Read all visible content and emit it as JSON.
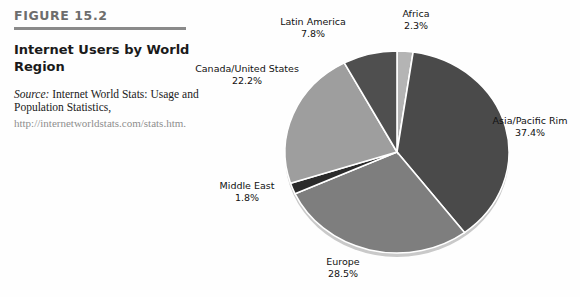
{
  "figure": {
    "number": "FIGURE 15.2",
    "title": "Internet Users by World Region",
    "source_label": "Source:",
    "source_text": " Internet World Stats: Usage and Population Statistics,",
    "source_url": "http://internetworldstats.com/stats.htm."
  },
  "chart_data": {
    "type": "pie",
    "title": "Internet Users by World Region",
    "unit": "%",
    "legend": "none",
    "labels_position": "outside",
    "start_angle_deg": -90,
    "direction": "clockwise",
    "categories": [
      "Africa",
      "Asia/Pacific Rim",
      "Europe",
      "Middle East",
      "Canada/United States",
      "Latin America"
    ],
    "values": [
      2.3,
      37.4,
      28.5,
      1.8,
      22.2,
      7.8
    ],
    "slices": [
      {
        "name": "Africa",
        "value": 2.3,
        "label": "Africa",
        "pct_text": "2.3%",
        "color": "#b4b4b4"
      },
      {
        "name": "Asia/Pacific Rim",
        "value": 37.4,
        "label": "Asia/Pacific Rim",
        "pct_text": "37.4%",
        "color": "#4a4a4a"
      },
      {
        "name": "Europe",
        "value": 28.5,
        "label": "Europe",
        "pct_text": "28.5%",
        "color": "#7e7e7e"
      },
      {
        "name": "Middle East",
        "value": 1.8,
        "label": "Middle East",
        "pct_text": "1.8%",
        "color": "#2b2b2b"
      },
      {
        "name": "Canada/United States",
        "value": 22.2,
        "label": "Canada/United States",
        "pct_text": "22.2%",
        "color": "#9e9e9e"
      },
      {
        "name": "Latin America",
        "value": 7.8,
        "label": "Latin America",
        "pct_text": "7.8%",
        "color": "#4f4f4f"
      }
    ]
  },
  "colors": {
    "rule": "#8a8a8a",
    "figure_number": "#6d6d6d",
    "title": "#1a1a1a",
    "url": "#8e8e8e",
    "pie_rim": "#c9c9c9",
    "slice_edge": "#ffffff"
  }
}
